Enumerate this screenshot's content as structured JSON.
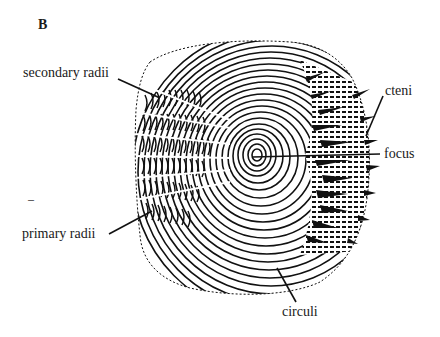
{
  "figure": {
    "panel_letter": "B",
    "colors": {
      "ink": "#111111",
      "background": "#ffffff",
      "text": "#1a1a1a"
    }
  },
  "labels": {
    "secondary_radii": "secondary radii",
    "primary_radii": "primary radii",
    "cteni": "cteni",
    "focus": "focus",
    "circuli": "circuli"
  },
  "stray_mark": "–"
}
